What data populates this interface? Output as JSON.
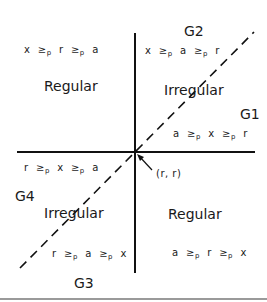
{
  "point_label": "(r, r)",
  "regions": [
    {
      "id": "G2",
      "label": "G2",
      "relation": [
        "x",
        "a",
        "r"
      ],
      "kind": "Irregular"
    },
    {
      "id": "G1",
      "label": "G1",
      "relation": [
        "a",
        "x",
        "r"
      ],
      "kind": ""
    },
    {
      "id": "TL",
      "label": "",
      "relation": [
        "x",
        "r",
        "a"
      ],
      "kind": "Regular"
    },
    {
      "id": "G4",
      "label": "G4",
      "relation": [
        "r",
        "x",
        "a"
      ],
      "kind": "Irregular"
    },
    {
      "id": "G3",
      "label": "G3",
      "relation": [
        "r",
        "a",
        "x"
      ],
      "kind": ""
    },
    {
      "id": "BR",
      "label": "",
      "relation": [
        "a",
        "r",
        "x"
      ],
      "kind": "Regular"
    }
  ],
  "texts": {
    "tl_regular": "Regular",
    "tr_irregular": "Irregular",
    "bl_irregular": "Irregular",
    "br_regular": "Regular",
    "g1": "G1",
    "g2": "G2",
    "g3": "G3",
    "g4": "G4",
    "ge": "≥",
    "p": "p"
  },
  "relations": {
    "tl": [
      "x",
      "r",
      "a"
    ],
    "tr": [
      "x",
      "a",
      "r"
    ],
    "g1": [
      "a",
      "x",
      "r"
    ],
    "g4": [
      "r",
      "x",
      "a"
    ],
    "g3": [
      "r",
      "a",
      "x"
    ],
    "br": [
      "a",
      "r",
      "x"
    ]
  }
}
